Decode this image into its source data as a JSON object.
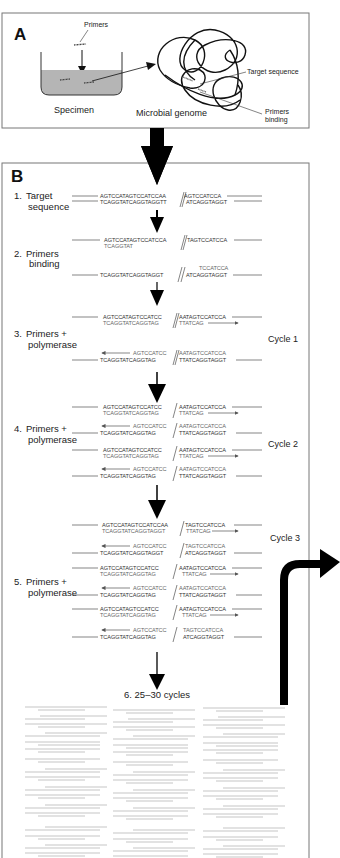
{
  "panel_a": {
    "label": "A",
    "primers_label": "Primers",
    "specimen_label": "Specimen",
    "genome_label": "Microbial genome",
    "target_label": "Target sequence",
    "binding_label_1": "Primers",
    "binding_label_2": "binding"
  },
  "panel_b": {
    "label": "B",
    "steps": [
      {
        "num": "1.",
        "line1": "Target",
        "line2": "sequence"
      },
      {
        "num": "2.",
        "line1": "Primers",
        "line2": "binding"
      },
      {
        "num": "3.",
        "line1": "Primers +",
        "line2": "polymerase"
      },
      {
        "num": "4.",
        "line1": "Primers +",
        "line2": "polymerase"
      },
      {
        "num": "5.",
        "line1": "Primers +",
        "line2": "polymerase"
      },
      {
        "num": "6.",
        "line1": "25–30 cycles",
        "line2": ""
      }
    ],
    "cycles": [
      "Cycle 1",
      "Cycle 2",
      "Cycle 3"
    ],
    "sequences": {
      "target_top_left": "AGTCCATAGTCCATCCAA",
      "target_top_right": "AGTCCATCCA",
      "target_bot_left": "TCAGGTATCAGGTAGGTT",
      "target_bot_right": "ATCAGGTAGGT",
      "bind_top_left": "AGTCCATAGTCCATCCA",
      "bind_top_right": "TAGTCCATCCA",
      "primer_fwd": "TCAGGTAT",
      "bind_bot_left": "TCAGGTATCAGGTAGGT",
      "bind_bot_right": "ATCAGGTAGGT",
      "primer_rev": "TCCATCCA",
      "ext_top_left": "AGTCCATAGTCCATCC",
      "ext_top_right": "AATAGTCCATCCA",
      "ext_new_left": "TCAGGTATCAGGTAG",
      "ext_new_right": "TTATCAG",
      "rev_new_left": "AGTCCATCC",
      "rev_new_right": "AATAGTCCATCCA",
      "rev_bot_left": "TCAGGTATCAGGTAG",
      "rev_bot_right": "TTATCAGGTAGGT"
    }
  }
}
